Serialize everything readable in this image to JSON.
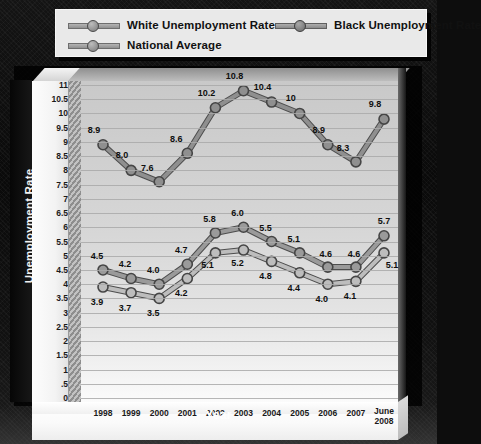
{
  "legend": {
    "items": [
      {
        "label": "White Unemployment Rate",
        "key": "white-key"
      },
      {
        "label": "Black Unemployment Rate",
        "key": "black-key"
      },
      {
        "label": "National Average",
        "key": "national-key"
      }
    ]
  },
  "chart_data": {
    "type": "line",
    "title": "",
    "xlabel": "Year",
    "ylabel": "Unemployment Rate",
    "categories": [
      "1998",
      "1999",
      "2000",
      "2001",
      "2002",
      "2003",
      "2004",
      "2005",
      "2006",
      "2007",
      "June\n2008"
    ],
    "category_labels": [
      "1998",
      "1999",
      "2000",
      "2001",
      "2002",
      "2003",
      "2004",
      "2005",
      "2006",
      "2007",
      "June 2008"
    ],
    "ylim": [
      0,
      11
    ],
    "ytick_labels": [
      "11",
      "10.5",
      "10",
      "9.5",
      "9",
      "8.5",
      "8",
      "7.5",
      "7",
      "6.5",
      "6",
      "5.5",
      "5",
      "4.5",
      "4",
      "3.5",
      "3",
      "2.5",
      "2",
      "1.5",
      "1",
      ".5",
      "0"
    ],
    "ytick_values": [
      11,
      10.5,
      10,
      9.5,
      9,
      8.5,
      8,
      7.5,
      7,
      6.5,
      6,
      5.5,
      5,
      4.5,
      4,
      3.5,
      3,
      2.5,
      2,
      1.5,
      1,
      0.5,
      0
    ],
    "grid": true,
    "legend_position": "top",
    "series": [
      {
        "name": "Black Unemployment Rate",
        "values": [
          8.9,
          8.0,
          7.6,
          8.6,
          10.2,
          10.8,
          10.4,
          10,
          8.9,
          8.3,
          9.8
        ],
        "labels": [
          "8.9",
          "8.0",
          "7.6",
          "8.6",
          "10.2",
          "10.8",
          "10.4",
          "10",
          "8.9",
          "8.3",
          "9.8"
        ],
        "color": "#8f8f8f"
      },
      {
        "name": "National Average",
        "values": [
          4.5,
          4.2,
          4.0,
          4.7,
          5.8,
          6.0,
          5.5,
          5.1,
          4.6,
          4.6,
          5.7
        ],
        "labels": [
          "4.5",
          "4.2",
          "4.0",
          "4.7",
          "5.8",
          "6.0",
          "5.5",
          "5.1",
          "4.6",
          "4.6",
          "5.7"
        ],
        "color": "#9a9a9a"
      },
      {
        "name": "White Unemployment Rate",
        "values": [
          3.9,
          3.7,
          3.5,
          4.2,
          5.1,
          5.2,
          4.8,
          4.4,
          4.0,
          4.1,
          5.1
        ],
        "labels": [
          "3.9",
          "3.7",
          "3.5",
          "4.2",
          "5.1",
          "5.2",
          "4.8",
          "4.4",
          "4.0",
          "4.1",
          "5.1"
        ],
        "color": "#bdbdbd"
      }
    ]
  }
}
